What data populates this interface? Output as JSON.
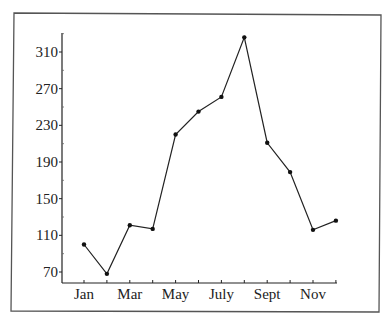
{
  "chart_data": {
    "type": "line",
    "title": "",
    "xlabel": "",
    "ylabel": "",
    "categories": [
      "Jan",
      "Feb",
      "Mar",
      "Apr",
      "May",
      "Jun",
      "Jul",
      "Aug",
      "Sep",
      "Oct",
      "Nov",
      "Dec"
    ],
    "x_tick_labels": [
      "Jan",
      "Mar",
      "May",
      "July",
      "Sept",
      "Nov"
    ],
    "x_tick_label_indices": [
      0,
      2,
      4,
      6,
      8,
      10
    ],
    "series": [
      {
        "name": "values",
        "values": [
          100,
          68,
          121,
          117,
          220,
          245,
          261,
          326,
          211,
          179,
          116,
          126
        ]
      }
    ],
    "y_ticks": [
      70,
      110,
      150,
      190,
      230,
      270,
      310
    ],
    "ylim": [
      60,
      340
    ],
    "grid": false,
    "legend": null,
    "markers": true,
    "line_color": "#222222",
    "frame": true
  }
}
